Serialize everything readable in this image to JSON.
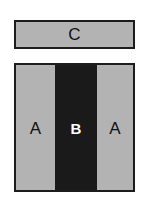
{
  "figure": {
    "type": "layer-stack-schematic",
    "background_color": "#ffffff",
    "border_color": "#1c1c1c",
    "gray_fill": "#b3b3b3",
    "dark_fill": "#1a1a1a"
  },
  "top_layer": {
    "label": "C",
    "fill": "#b3b3b3",
    "text_color": "#111111"
  },
  "bottom_block": {
    "bands": [
      {
        "label": "A",
        "fill": "#b3b3b3",
        "text_color": "#111111",
        "weight": "normal"
      },
      {
        "label": "B",
        "fill": "#1a1a1a",
        "text_color": "#ffffff",
        "weight": "bold"
      },
      {
        "label": "A",
        "fill": "#b3b3b3",
        "text_color": "#111111",
        "weight": "normal"
      }
    ]
  }
}
